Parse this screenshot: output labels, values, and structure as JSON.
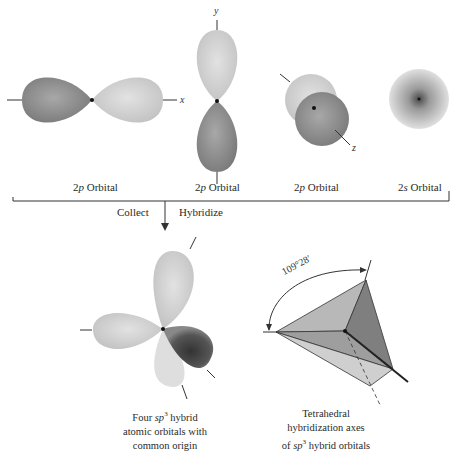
{
  "top_row": {
    "orbitals": [
      {
        "label_num": "2",
        "label_sym": "p",
        "label_rest": " Orbital",
        "axis": "x"
      },
      {
        "label_num": "2",
        "label_sym": "p",
        "label_rest": " Orbital",
        "axis": "y"
      },
      {
        "label_num": "2",
        "label_sym": "p",
        "label_rest": " Orbital",
        "axis": "z"
      },
      {
        "label_num": "2",
        "label_sym": "s",
        "label_rest": " Orbital",
        "axis": ""
      }
    ]
  },
  "process": {
    "left_label": "Collect",
    "right_label": "Hybridize"
  },
  "bottom_left": {
    "caption_line1_pre": "Four ",
    "caption_line1_sym": "sp",
    "caption_line1_sup": "3",
    "caption_line1_post": " hybrid",
    "caption_line2": "atomic orbitals with",
    "caption_line3": "common origin"
  },
  "bottom_right": {
    "angle_label": "109°28′",
    "caption_line1": "Tetrahedral",
    "caption_line2": "hybridization axes",
    "caption_line3_pre": "of ",
    "caption_line3_sym": "sp",
    "caption_line3_sup": "3",
    "caption_line3_post": " hybrid orbitals"
  },
  "colors": {
    "lobe_dark": "#8a8a8a",
    "lobe_light": "#d4d4d4",
    "line": "#333333"
  }
}
